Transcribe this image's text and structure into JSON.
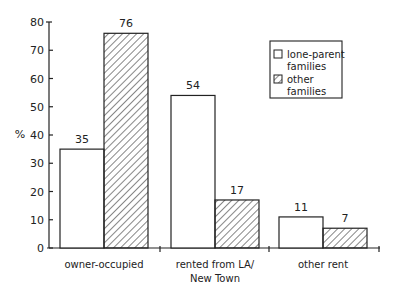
{
  "chart_data": {
    "type": "bar",
    "title": "",
    "xlabel": "",
    "ylabel": "%",
    "ylim": [
      0,
      80
    ],
    "yticks": [
      0,
      10,
      20,
      30,
      40,
      50,
      60,
      70,
      80
    ],
    "categories": [
      "owner-occupied",
      "rented from LA/ New Town",
      "other rent"
    ],
    "category_lines": [
      [
        "owner-occupied"
      ],
      [
        "rented from LA/",
        "New Town"
      ],
      [
        "other rent"
      ]
    ],
    "series": [
      {
        "name": "lone-parent families",
        "values": [
          35,
          54,
          11
        ],
        "pattern": "open"
      },
      {
        "name": "other families",
        "values": [
          76,
          17,
          7
        ],
        "pattern": "hatched"
      }
    ],
    "legend": {
      "position": "upper right",
      "entries": [
        [
          "lone-parent",
          "families"
        ],
        [
          "other",
          "families"
        ]
      ]
    },
    "grid": false
  }
}
